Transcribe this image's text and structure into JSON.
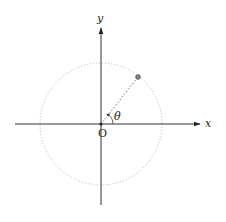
{
  "diagram": {
    "type": "polar-coordinate-unit-circle",
    "labels": {
      "x_axis": "x",
      "y_axis": "y",
      "origin": "O",
      "angle": "θ"
    },
    "colors": {
      "axis": "#333333",
      "circle": "#aaaaaa",
      "radius_line": "#555555",
      "point_fill": "#888888",
      "point_stroke": "#444444"
    },
    "geometry": {
      "origin": [
        101,
        124
      ],
      "circle_radius": 61,
      "point": [
        138,
        77
      ]
    }
  }
}
